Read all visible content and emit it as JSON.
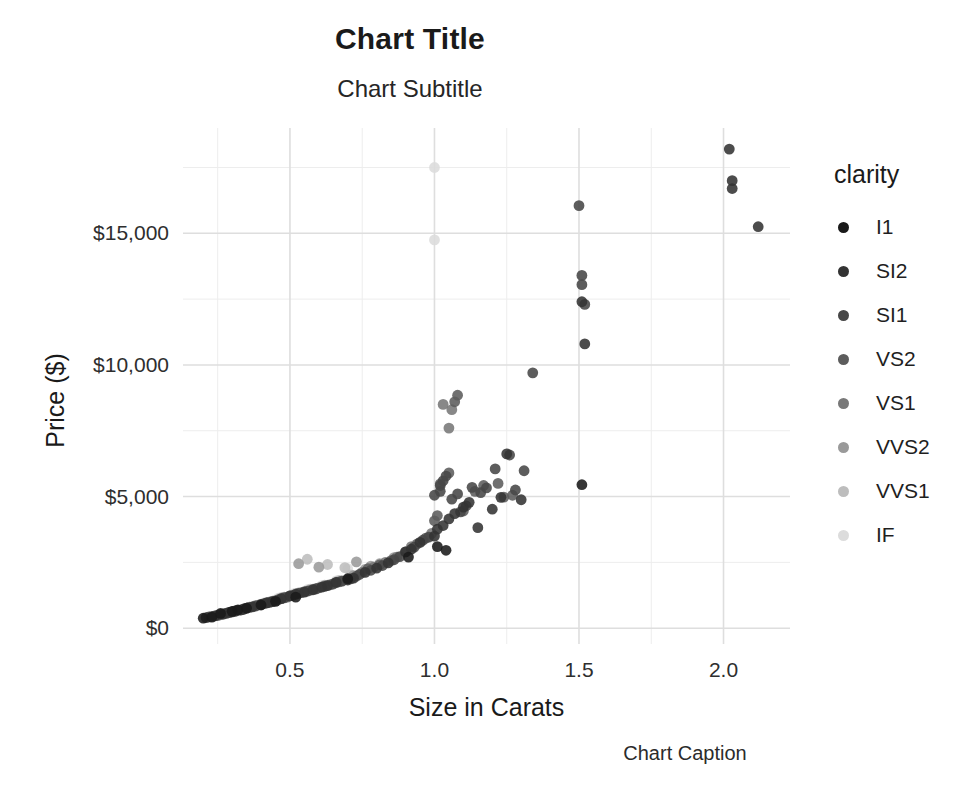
{
  "chart_data": {
    "type": "scatter",
    "title": "Chart Title",
    "subtitle": "Chart Subtitle",
    "caption": "Chart Caption",
    "xlabel": "Size in Carats",
    "ylabel": "Price ($)",
    "grid": true,
    "legend_position": "right",
    "legend_title": "clarity",
    "xlim": [
      0.13,
      2.23
    ],
    "ylim": [
      -600,
      19000
    ],
    "xticks": [
      0.5,
      1.0,
      1.5,
      2.0
    ],
    "xtick_labels": [
      "0.5",
      "1.0",
      "1.5",
      "2.0"
    ],
    "yticks": [
      0,
      5000,
      10000,
      15000
    ],
    "ytick_labels": [
      "$0",
      "$5,000",
      "$10,000",
      "$15,000"
    ],
    "xminor": [
      0.25,
      0.75,
      1.25,
      1.75,
      2.25
    ],
    "yminor": [
      2500,
      7500,
      12500,
      17500
    ],
    "color_by": "clarity",
    "legend_entries": [
      {
        "label": "I1",
        "color": "#1a1a1a"
      },
      {
        "label": "SI2",
        "color": "#333333"
      },
      {
        "label": "SI1",
        "color": "#474747"
      },
      {
        "label": "VS2",
        "color": "#5c5c5c"
      },
      {
        "label": "VS1",
        "color": "#787878"
      },
      {
        "label": "VVS2",
        "color": "#9a9a9a"
      },
      {
        "label": "VVS1",
        "color": "#bdbdbd"
      },
      {
        "label": "IF",
        "color": "#dcdcdc"
      }
    ],
    "series": [
      {
        "name": "I1",
        "color": "#1a1a1a",
        "points": [
          [
            0.2,
            380
          ],
          [
            0.23,
            420
          ],
          [
            0.26,
            560
          ],
          [
            0.3,
            640
          ],
          [
            0.32,
            700
          ],
          [
            0.35,
            760
          ],
          [
            0.4,
            880
          ],
          [
            0.45,
            1020
          ],
          [
            0.52,
            1180
          ],
          [
            0.7,
            1880
          ],
          [
            0.91,
            2700
          ],
          [
            1.01,
            3100
          ],
          [
            1.04,
            2960
          ],
          [
            1.51,
            5450
          ]
        ]
      },
      {
        "name": "SI2",
        "color": "#333333",
        "points": [
          [
            0.21,
            400
          ],
          [
            0.24,
            470
          ],
          [
            0.27,
            540
          ],
          [
            0.29,
            600
          ],
          [
            0.31,
            660
          ],
          [
            0.33,
            690
          ],
          [
            0.34,
            720
          ],
          [
            0.37,
            810
          ],
          [
            0.4,
            900
          ],
          [
            0.42,
            960
          ],
          [
            0.44,
            1010
          ],
          [
            0.47,
            1120
          ],
          [
            0.5,
            1230
          ],
          [
            0.52,
            1290
          ],
          [
            0.55,
            1370
          ],
          [
            0.58,
            1460
          ],
          [
            0.61,
            1560
          ],
          [
            0.63,
            1620
          ],
          [
            0.66,
            1740
          ],
          [
            0.7,
            1830
          ],
          [
            0.72,
            1900
          ],
          [
            0.76,
            2120
          ],
          [
            0.8,
            2280
          ],
          [
            0.84,
            2480
          ],
          [
            0.9,
            2900
          ],
          [
            0.92,
            3000
          ],
          [
            0.95,
            3260
          ],
          [
            1.0,
            3500
          ],
          [
            1.01,
            3760
          ],
          [
            1.03,
            3900
          ],
          [
            1.05,
            4150
          ],
          [
            1.07,
            4350
          ],
          [
            1.1,
            4600
          ],
          [
            1.12,
            4780
          ],
          [
            1.15,
            3820
          ],
          [
            1.2,
            4520
          ],
          [
            1.23,
            4970
          ],
          [
            1.25,
            6620
          ],
          [
            1.3,
            4880
          ],
          [
            1.51,
            12400
          ],
          [
            1.52,
            10800
          ],
          [
            2.03,
            16700
          ],
          [
            2.03,
            17000
          ],
          [
            2.02,
            18200
          ],
          [
            2.12,
            15250
          ]
        ]
      },
      {
        "name": "SI1",
        "color": "#474747",
        "points": [
          [
            0.22,
            430
          ],
          [
            0.25,
            500
          ],
          [
            0.28,
            570
          ],
          [
            0.3,
            620
          ],
          [
            0.32,
            680
          ],
          [
            0.35,
            760
          ],
          [
            0.38,
            840
          ],
          [
            0.41,
            930
          ],
          [
            0.43,
            980
          ],
          [
            0.46,
            1080
          ],
          [
            0.48,
            1150
          ],
          [
            0.51,
            1250
          ],
          [
            0.53,
            1320
          ],
          [
            0.56,
            1410
          ],
          [
            0.59,
            1490
          ],
          [
            0.62,
            1590
          ],
          [
            0.65,
            1680
          ],
          [
            0.68,
            1790
          ],
          [
            0.71,
            1870
          ],
          [
            0.74,
            2040
          ],
          [
            0.78,
            2200
          ],
          [
            0.82,
            2380
          ],
          [
            0.86,
            2600
          ],
          [
            0.88,
            2720
          ],
          [
            0.93,
            3080
          ],
          [
            0.96,
            3340
          ],
          [
            0.98,
            3460
          ],
          [
            1.0,
            5050
          ],
          [
            1.02,
            5200
          ],
          [
            1.02,
            5420
          ],
          [
            1.03,
            5600
          ],
          [
            1.04,
            5780
          ],
          [
            1.06,
            4900
          ],
          [
            1.08,
            5100
          ],
          [
            1.09,
            4420
          ],
          [
            1.11,
            4650
          ],
          [
            1.13,
            5350
          ],
          [
            1.16,
            5150
          ],
          [
            1.18,
            5330
          ],
          [
            1.21,
            6050
          ],
          [
            1.26,
            6580
          ],
          [
            1.28,
            5250
          ],
          [
            1.31,
            5980
          ],
          [
            1.34,
            9700
          ],
          [
            1.5,
            16050
          ],
          [
            1.51,
            13050
          ],
          [
            1.51,
            13400
          ],
          [
            1.52,
            12300
          ]
        ]
      },
      {
        "name": "VS2",
        "color": "#5c5c5c",
        "points": [
          [
            0.23,
            450
          ],
          [
            0.26,
            520
          ],
          [
            0.29,
            600
          ],
          [
            0.31,
            650
          ],
          [
            0.34,
            730
          ],
          [
            0.36,
            790
          ],
          [
            0.39,
            880
          ],
          [
            0.42,
            960
          ],
          [
            0.45,
            1050
          ],
          [
            0.49,
            1180
          ],
          [
            0.54,
            1350
          ],
          [
            0.57,
            1440
          ],
          [
            0.6,
            1530
          ],
          [
            0.64,
            1650
          ],
          [
            0.67,
            1760
          ],
          [
            0.73,
            1980
          ],
          [
            0.77,
            2260
          ],
          [
            0.81,
            2400
          ],
          [
            0.85,
            2570
          ],
          [
            0.9,
            2900
          ],
          [
            0.94,
            3200
          ],
          [
            0.97,
            3420
          ],
          [
            1.0,
            4080
          ],
          [
            1.01,
            4280
          ],
          [
            1.02,
            5480
          ],
          [
            1.05,
            5900
          ],
          [
            1.07,
            8600
          ],
          [
            1.08,
            8850
          ],
          [
            1.1,
            4450
          ],
          [
            1.14,
            5200
          ],
          [
            1.17,
            5420
          ],
          [
            1.22,
            5500
          ],
          [
            1.24,
            4980
          ],
          [
            1.27,
            5050
          ]
        ]
      },
      {
        "name": "VS1",
        "color": "#787878",
        "points": [
          [
            0.25,
            480
          ],
          [
            0.28,
            560
          ],
          [
            0.31,
            640
          ],
          [
            0.33,
            700
          ],
          [
            0.36,
            800
          ],
          [
            0.4,
            900
          ],
          [
            0.44,
            1030
          ],
          [
            0.47,
            1120
          ],
          [
            0.5,
            1230
          ],
          [
            0.55,
            1390
          ],
          [
            0.59,
            1500
          ],
          [
            0.62,
            1610
          ],
          [
            0.66,
            1740
          ],
          [
            0.7,
            1860
          ],
          [
            0.75,
            2120
          ],
          [
            0.79,
            2320
          ],
          [
            0.83,
            2500
          ],
          [
            0.87,
            2700
          ],
          [
            0.92,
            3100
          ],
          [
            0.99,
            3600
          ],
          [
            1.03,
            8500
          ],
          [
            1.05,
            7600
          ],
          [
            1.06,
            8300
          ]
        ]
      },
      {
        "name": "VVS2",
        "color": "#9a9a9a",
        "points": [
          [
            0.26,
            510
          ],
          [
            0.3,
            620
          ],
          [
            0.34,
            730
          ],
          [
            0.38,
            860
          ],
          [
            0.43,
            1000
          ],
          [
            0.48,
            1180
          ],
          [
            0.53,
            1340
          ],
          [
            0.58,
            1480
          ],
          [
            0.63,
            1640
          ],
          [
            0.68,
            1800
          ],
          [
            0.72,
            2000
          ],
          [
            0.76,
            2230
          ],
          [
            0.81,
            2450
          ],
          [
            0.86,
            2680
          ],
          [
            0.53,
            2450
          ],
          [
            0.6,
            2320
          ],
          [
            0.73,
            2520
          ],
          [
            0.78,
            2360
          ]
        ]
      },
      {
        "name": "VVS1",
        "color": "#bdbdbd",
        "points": [
          [
            0.27,
            530
          ],
          [
            0.32,
            680
          ],
          [
            0.37,
            820
          ],
          [
            0.42,
            980
          ],
          [
            0.47,
            1160
          ],
          [
            0.52,
            1320
          ],
          [
            0.57,
            1480
          ],
          [
            0.62,
            1640
          ],
          [
            0.67,
            1820
          ],
          [
            0.71,
            2020
          ],
          [
            0.63,
            2420
          ],
          [
            0.69,
            2300
          ],
          [
            0.56,
            2620
          ]
        ]
      },
      {
        "name": "IF",
        "color": "#dcdcdc",
        "points": [
          [
            0.3,
            620
          ],
          [
            0.36,
            800
          ],
          [
            0.41,
            960
          ],
          [
            0.46,
            1140
          ],
          [
            0.51,
            1300
          ],
          [
            0.56,
            1460
          ],
          [
            0.61,
            1620
          ],
          [
            0.66,
            1800
          ],
          [
            0.7,
            2260
          ],
          [
            1.0,
            17500
          ],
          [
            1.0,
            14750
          ]
        ]
      }
    ]
  }
}
